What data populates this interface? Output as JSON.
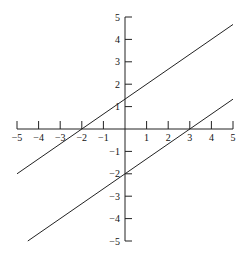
{
  "chart_data": {
    "type": "line",
    "title": "",
    "xlabel": "",
    "ylabel": "",
    "xlim": [
      -5,
      5
    ],
    "ylim": [
      -5,
      5
    ],
    "grid": false,
    "legend": null,
    "x_ticks": [
      -5,
      -4,
      -3,
      -2,
      -1,
      1,
      2,
      3,
      4,
      5
    ],
    "y_ticks": [
      -5,
      -4,
      -3,
      -2,
      -1,
      1,
      2,
      3,
      4,
      5
    ],
    "x_tick_labels": [
      "−5",
      "−4",
      "−3",
      "−2",
      "−1",
      "1",
      "2",
      "3",
      "4",
      "5"
    ],
    "y_tick_labels": [
      "−5",
      "−4",
      "−3",
      "−2",
      "−1",
      "1",
      "2",
      "3",
      "4",
      "5"
    ],
    "series": [
      {
        "name": "y = (2/3)x + 4/3",
        "slope": 0.6667,
        "intercept": 1.3333,
        "x": [
          -5,
          5
        ],
        "y": [
          -2,
          4.667
        ]
      },
      {
        "name": "y = (2/3)x − 2",
        "slope": 0.6667,
        "intercept": -2,
        "x": [
          -4.5,
          5
        ],
        "y": [
          -5,
          1.333
        ]
      }
    ],
    "line_color": "#222222"
  },
  "layout": {
    "origin_px": [
      125,
      129
    ],
    "px_per_unit_x": 21.6,
    "px_per_unit_y": 22.4
  }
}
